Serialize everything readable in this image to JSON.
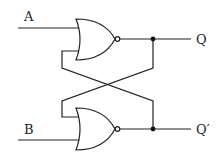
{
  "diagram": {
    "type": "SR latch (cross-coupled NOR gates)",
    "inputs": [
      {
        "label": "A"
      },
      {
        "label": "B"
      }
    ],
    "outputs": [
      {
        "label": "Q"
      },
      {
        "label": "Q′"
      }
    ],
    "gates": [
      {
        "type": "NOR",
        "position": "top"
      },
      {
        "type": "NOR",
        "position": "bottom"
      }
    ],
    "colors": {
      "line": "#222222",
      "background": "#ffffff"
    }
  }
}
